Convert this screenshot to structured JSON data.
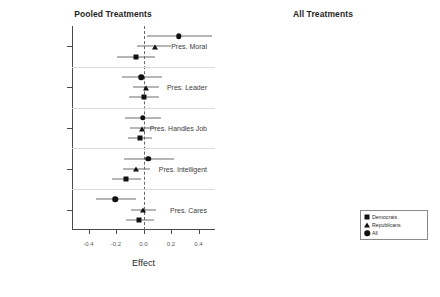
{
  "chart_data": [
    {
      "type": "scatter",
      "title": "Pooled Treatments",
      "xlabel": "Effect",
      "ylabel": "",
      "xlim": [
        -0.52,
        0.52
      ],
      "xticks": [
        -0.4,
        -0.2,
        0.0,
        0.2,
        0.4
      ],
      "xticklabels": [
        "-0.4",
        "-0.2",
        "0.0",
        "0.2",
        "0.4"
      ],
      "grid": false,
      "zero_reference_line": 0.0,
      "legend_position": "none",
      "categories": [
        "Pres. Moral",
        "Pres. Leader",
        "Pres. Handles Job",
        "Pres. Intelligent",
        "Pres. Cares"
      ],
      "series": [
        {
          "name": "All",
          "marker": "circle",
          "values": [
            0.255,
            -0.015,
            -0.005,
            0.035,
            -0.205
          ],
          "ci_low": [
            0.025,
            -0.155,
            -0.135,
            -0.145,
            -0.345
          ],
          "ci_high": [
            0.5,
            0.135,
            0.125,
            0.225,
            -0.055
          ]
        },
        {
          "name": "Republicans",
          "marker": "triangle",
          "values": [
            0.085,
            0.02,
            -0.01,
            -0.055,
            -0.005
          ],
          "ci_low": [
            -0.045,
            -0.075,
            -0.095,
            -0.15,
            -0.09
          ],
          "ci_high": [
            0.2,
            0.115,
            0.08,
            0.045,
            0.09
          ]
        },
        {
          "name": "Democrats",
          "marker": "square",
          "values": [
            -0.055,
            0.005,
            -0.025,
            -0.125,
            -0.03
          ],
          "ci_low": [
            -0.19,
            -0.105,
            -0.11,
            -0.23,
            -0.13
          ],
          "ci_high": [
            0.08,
            0.115,
            0.06,
            -0.02,
            0.075
          ]
        }
      ]
    },
    {
      "type": "scatter",
      "title": "All Treatments",
      "xlabel": "Effect",
      "ylabel": "",
      "xlim": [
        -0.74,
        0.3
      ],
      "xticks": [
        -0.6,
        -0.4,
        -0.2,
        0.0,
        0.2
      ],
      "xticklabels": [
        "-0.6",
        "-0.4",
        "-0.2",
        "0.0",
        "0.2"
      ],
      "grid": false,
      "zero_reference_line": 0.0,
      "legend_position": "bottom-right",
      "categories": [
        "Health Security Act",
        "Pres. Handles HC",
        "Gov. Involved HC",
        "Pres. Handles Ed."
      ],
      "series": [
        {
          "name": "All",
          "marker": "circle",
          "values": [
            -0.01,
            -0.145,
            -0.06,
            -0.275
          ],
          "ci_low": [
            -0.185,
            -0.31,
            -0.23,
            -0.455
          ],
          "ci_high": [
            0.165,
            0.02,
            0.11,
            -0.095
          ]
        },
        {
          "name": "Republicans",
          "marker": "triangle",
          "values": [
            0.075,
            0.055,
            -0.09,
            -0.02
          ],
          "ci_low": [
            0.015,
            -0.02,
            -0.215,
            -0.09
          ],
          "ci_high": [
            0.14,
            0.13,
            0.035,
            0.05
          ]
        },
        {
          "name": "Democrats",
          "marker": "square",
          "values": [
            0.05,
            0.09,
            -0.055,
            0.0
          ],
          "ci_low": [
            -0.01,
            0.02,
            -0.16,
            -0.055
          ],
          "ci_high": [
            0.11,
            0.16,
            0.05,
            0.055
          ]
        }
      ]
    }
  ],
  "panels": {
    "left": {
      "title": "Pooled Treatments",
      "xlabel": "Effect"
    },
    "right": {
      "title": "All Treatments",
      "xlabel": "Effect"
    }
  },
  "legend": {
    "entries": [
      {
        "label": "Democrats",
        "marker": "square"
      },
      {
        "label": "Republicans",
        "marker": "triangle"
      },
      {
        "label": "All",
        "marker": "circle"
      }
    ]
  }
}
